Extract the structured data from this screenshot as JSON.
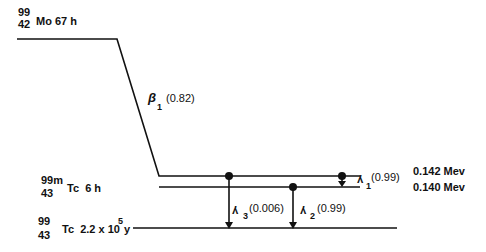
{
  "diagram": {
    "type": "nuclear-decay-scheme",
    "levels": [
      {
        "id": "mo99",
        "mass": "99",
        "atomic": "42",
        "symbol": "Mo",
        "halflife": "67 h"
      },
      {
        "id": "tc99m",
        "mass": "99",
        "meta": "m",
        "atomic": "43",
        "symbol": "Tc",
        "halflife": "6 h"
      },
      {
        "id": "tc99",
        "mass": "99",
        "atomic": "43",
        "symbol": "Tc",
        "halflife_base": "2.2 x 10",
        "halflife_exp": "5",
        "halflife_unit": "y"
      }
    ],
    "energies": [
      "0.142 Mev",
      "0.140 Mev"
    ],
    "transitions": {
      "beta1": {
        "symbol": "β",
        "sub": "1",
        "fraction": "(0.82)"
      },
      "gamma1": {
        "symbol": "γ",
        "sub": "1",
        "fraction": "(0.99)"
      },
      "gamma2": {
        "symbol": "γ",
        "sub": "2",
        "fraction": "(0.99)"
      },
      "gamma3": {
        "symbol": "γ",
        "sub": "3",
        "fraction": "(0.006)"
      }
    }
  }
}
